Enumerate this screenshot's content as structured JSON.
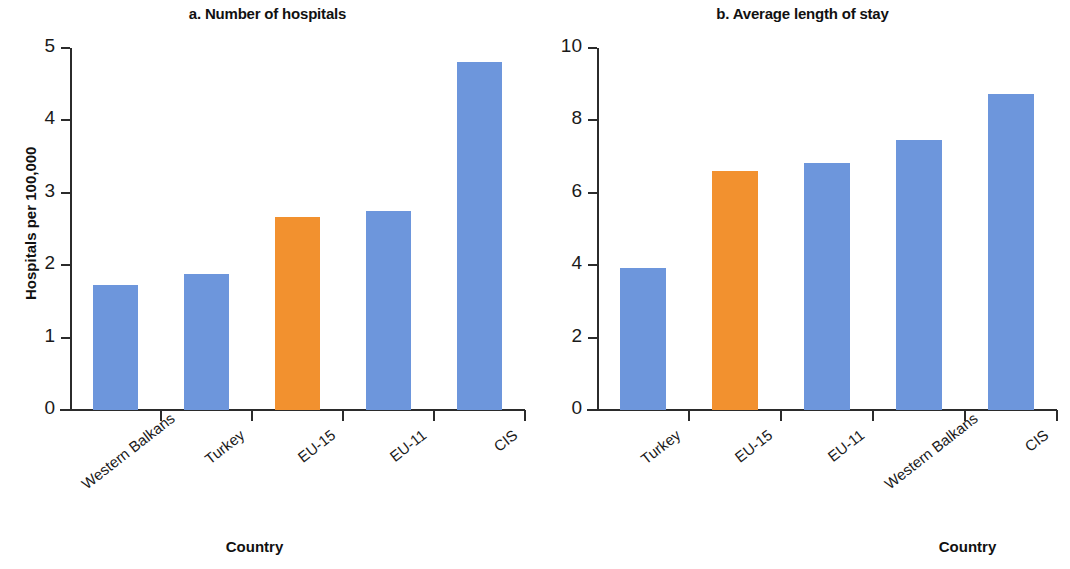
{
  "colors": {
    "blue": "#6d96dc",
    "orange": "#f2912f",
    "axis": "#2b2b2b",
    "text": "#111111",
    "background": "#ffffff"
  },
  "panels": [
    {
      "title": "a. Number of hospitals",
      "ylabel": "Hospitals per 100,000",
      "xlabel": "Country",
      "yticks": [
        "0",
        "1",
        "2",
        "3",
        "4",
        "5"
      ],
      "categories": [
        "Western Balkans",
        "Turkey",
        "EU-15",
        "EU-11",
        "CIS"
      ]
    },
    {
      "title": "b. Average length of stay",
      "ylabel": "Days",
      "xlabel": "Country",
      "yticks": [
        "0",
        "2",
        "4",
        "6",
        "8",
        "10"
      ],
      "categories": [
        "Turkey",
        "EU-15",
        "EU-11",
        "Western Balkans",
        "CIS"
      ]
    }
  ],
  "chart_data": [
    {
      "type": "bar",
      "title": "a. Number of hospitals",
      "xlabel": "Country",
      "ylabel": "Hospitals per 100,000",
      "ylim": [
        0,
        5
      ],
      "yticks": [
        0,
        1,
        2,
        3,
        4,
        5
      ],
      "grid": false,
      "legend": null,
      "categories": [
        "Western Balkans",
        "Turkey",
        "EU-15",
        "EU-11",
        "CIS"
      ],
      "values": [
        1.72,
        1.88,
        2.66,
        2.75,
        4.81
      ],
      "bar_colors": [
        "#6d96dc",
        "#6d96dc",
        "#f2912f",
        "#6d96dc",
        "#6d96dc"
      ],
      "highlight_category": "EU-15"
    },
    {
      "type": "bar",
      "title": "b. Average length of stay",
      "xlabel": "Country",
      "ylabel": "Days",
      "ylim": [
        0,
        10
      ],
      "yticks": [
        0,
        2,
        4,
        6,
        8,
        10
      ],
      "grid": false,
      "legend": null,
      "categories": [
        "Turkey",
        "EU-15",
        "EU-11",
        "Western Balkans",
        "CIS"
      ],
      "values": [
        3.92,
        6.6,
        6.82,
        7.45,
        8.72
      ],
      "bar_colors": [
        "#6d96dc",
        "#f2912f",
        "#6d96dc",
        "#6d96dc",
        "#6d96dc"
      ],
      "highlight_category": "EU-15"
    }
  ]
}
